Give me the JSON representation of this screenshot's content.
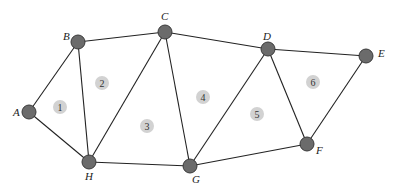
{
  "diagram": {
    "type": "planar-graph",
    "nodes": [
      {
        "id": "A",
        "label": "A",
        "x": 29,
        "y": 112,
        "lx": 13,
        "ly": 116
      },
      {
        "id": "B",
        "label": "B",
        "x": 78,
        "y": 42,
        "lx": 63,
        "ly": 40
      },
      {
        "id": "C",
        "label": "C",
        "x": 165,
        "y": 32,
        "lx": 161,
        "ly": 20
      },
      {
        "id": "D",
        "label": "D",
        "x": 268,
        "y": 49,
        "lx": 263,
        "ly": 40
      },
      {
        "id": "E",
        "label": "E",
        "x": 366,
        "y": 56,
        "lx": 378,
        "ly": 57
      },
      {
        "id": "F",
        "label": "F",
        "x": 307,
        "y": 144,
        "lx": 316,
        "ly": 154
      },
      {
        "id": "G",
        "label": "G",
        "x": 190,
        "y": 166,
        "lx": 192,
        "ly": 183
      },
      {
        "id": "H",
        "label": "H",
        "x": 89,
        "y": 162,
        "lx": 85,
        "ly": 180
      }
    ],
    "edges": [
      [
        "A",
        "B"
      ],
      [
        "A",
        "H"
      ],
      [
        "B",
        "H"
      ],
      [
        "B",
        "C"
      ],
      [
        "C",
        "H"
      ],
      [
        "C",
        "G"
      ],
      [
        "C",
        "D"
      ],
      [
        "D",
        "G"
      ],
      [
        "D",
        "F"
      ],
      [
        "D",
        "E"
      ],
      [
        "E",
        "F"
      ],
      [
        "F",
        "G"
      ],
      [
        "H",
        "G"
      ]
    ],
    "regions": [
      {
        "label": "1",
        "x": 60,
        "y": 107
      },
      {
        "label": "2",
        "x": 102,
        "y": 83
      },
      {
        "label": "3",
        "x": 147,
        "y": 126
      },
      {
        "label": "4",
        "x": 203,
        "y": 97
      },
      {
        "label": "5",
        "x": 257,
        "y": 114
      },
      {
        "label": "6",
        "x": 313,
        "y": 82
      }
    ]
  }
}
